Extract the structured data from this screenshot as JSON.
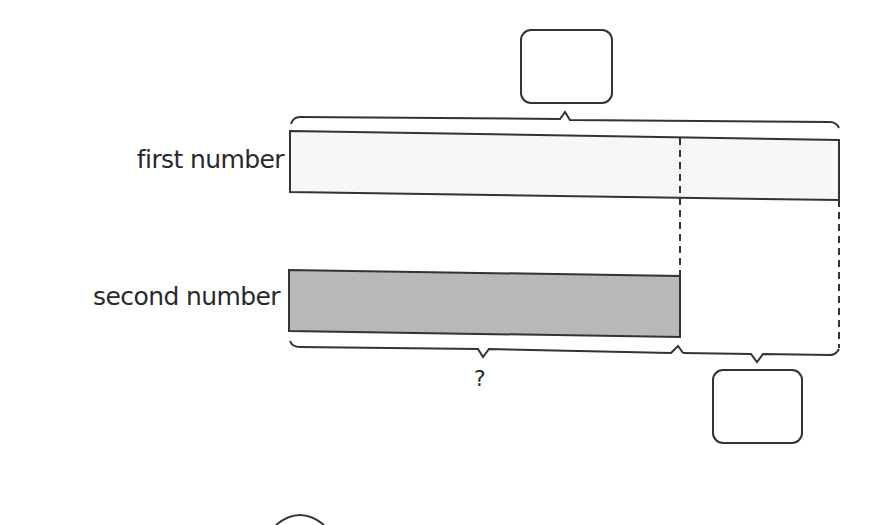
{
  "diagram": {
    "type": "bar-model",
    "bars": [
      {
        "label": "first number",
        "fill": "#f7f7f7",
        "relative_length": 1.0
      },
      {
        "label": "second number",
        "fill": "#b8b8b8",
        "relative_length": 0.71
      }
    ],
    "top_brace": {
      "spans": "first number",
      "answer_box": ""
    },
    "bottom_braces": [
      {
        "spans": "second number",
        "text": "?"
      },
      {
        "spans": "difference",
        "answer_box": ""
      }
    ]
  },
  "colors": {
    "stroke": "#333333",
    "first_fill": "#f7f7f7",
    "second_fill": "#b8b8b8"
  }
}
